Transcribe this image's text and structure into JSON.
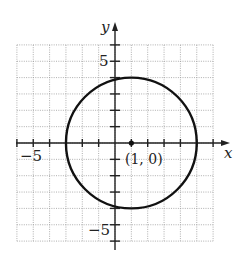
{
  "chart_data": {
    "type": "line",
    "title": "",
    "xlabel": "x",
    "ylabel": "y",
    "xlim": [
      -6,
      6
    ],
    "ylim": [
      -6,
      6
    ],
    "grid": true,
    "x_tick_labels": [
      {
        "value": -5,
        "label": "−5"
      }
    ],
    "y_tick_labels": [
      {
        "value": 5,
        "label": "5"
      },
      {
        "value": -5,
        "label": "−5"
      }
    ],
    "series": [
      {
        "name": "circle",
        "shape": "circle",
        "center": [
          1,
          0
        ],
        "radius": 4,
        "equation": "(x-1)^2 + y^2 = 16"
      }
    ],
    "points": [
      {
        "x": 1,
        "y": 0,
        "label": "(1, 0)"
      }
    ],
    "annotations": [
      "(1, 0)"
    ]
  },
  "labels": {
    "x_axis": "x",
    "y_axis": "y",
    "x_neg5": "−5",
    "y_pos5": "5",
    "y_neg5": "−5",
    "center_point": "(1, 0)"
  }
}
